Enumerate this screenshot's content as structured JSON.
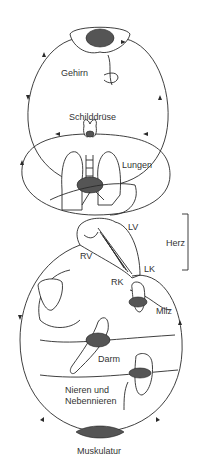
{
  "diagram": {
    "type": "circulatory-system",
    "labels": {
      "brain": "Gehirn",
      "thyroid": "Schilddrüse",
      "lungs": "Lungen",
      "lv": "LV",
      "heart": "Herz",
      "rv": "RV",
      "lk": "LK",
      "rk": "RK",
      "spleen": "Milz",
      "intestine": "Darm",
      "kidneys_line1": "Nieren und",
      "kidneys_line2": "Nebennieren",
      "muscle": "Muskulatur"
    },
    "colors": {
      "line": "#2a2a2a",
      "text": "#333333",
      "background": "#ffffff"
    }
  }
}
